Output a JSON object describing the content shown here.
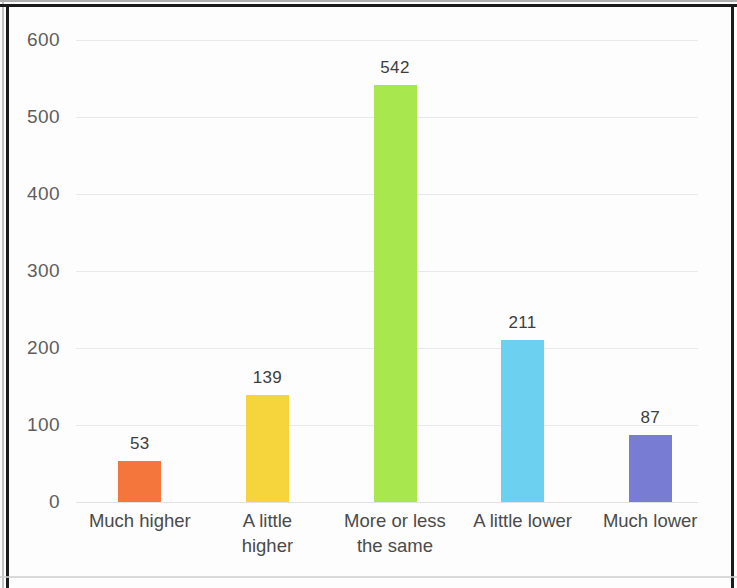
{
  "chart_data": {
    "type": "bar",
    "title": "",
    "subtitle": "",
    "xlabel": "",
    "ylabel": "",
    "grid": true,
    "legend": "none",
    "ylim": [
      0,
      600
    ],
    "yticks": [
      0,
      100,
      200,
      300,
      400,
      500,
      600
    ],
    "ytick_labels": [
      "0",
      "100",
      "200",
      "300",
      "400",
      "500",
      "600"
    ],
    "categories": [
      "Much higher",
      "A little higher",
      "More or less the same",
      "A little lower",
      "Much lower"
    ],
    "category_lines": [
      [
        "Much higher",
        ""
      ],
      [
        "A little",
        "higher"
      ],
      [
        "More or less",
        "the same"
      ],
      [
        "A little lower",
        ""
      ],
      [
        "Much lower",
        ""
      ]
    ],
    "values": [
      53,
      139,
      542,
      211,
      87
    ],
    "value_labels": [
      "53",
      "139",
      "542",
      "211",
      "87"
    ],
    "colors": [
      "#F4763D",
      "#F6D53C",
      "#A8E84E",
      "#6CD0F0",
      "#787CD2"
    ],
    "bar_color_names": [
      "orange",
      "yellow",
      "green",
      "light-blue",
      "purple"
    ]
  },
  "axis": {
    "y_axis_max_label": "600",
    "y_axis_min_label": "0"
  },
  "colors": {
    "background": "#fdfdfd",
    "gridline": "#e9e9e9",
    "tick_text": "#5d5d5d",
    "label_text": "#4a4a4a",
    "value_text": "#3d3d3d",
    "border": "#1b1b1b"
  }
}
